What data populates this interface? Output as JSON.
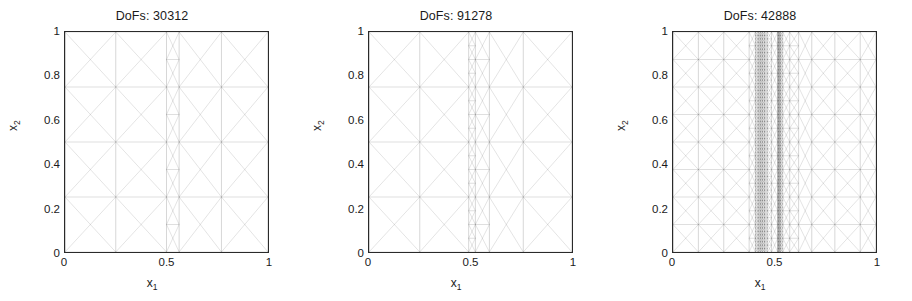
{
  "figure": {
    "background": "#ffffff",
    "line_color": "#2a2a2a",
    "text_color": "#1a1a1a"
  },
  "axes": {
    "xlabel": "x",
    "xlabel_sub": "1",
    "ylabel": "x",
    "ylabel_sub": "2",
    "xticks": [
      "0",
      "0.5",
      "1"
    ],
    "xtick_values": [
      0,
      0.5,
      1
    ],
    "yticks": [
      "0",
      "0.2",
      "0.4",
      "0.6",
      "0.8",
      "1"
    ],
    "ytick_values": [
      0,
      0.2,
      0.4,
      0.6,
      0.8,
      1
    ],
    "xlim": [
      0,
      1
    ],
    "ylim": [
      0,
      1
    ]
  },
  "chart_data": {
    "type": "diagram",
    "subtype": "adaptive-finite-element-mesh",
    "xlabel": "x_1",
    "ylabel": "x_2",
    "xlim": [
      0,
      1
    ],
    "ylim": [
      0,
      1
    ],
    "grid": false,
    "legend": null,
    "panels": [
      {
        "index": 0,
        "title": "DoFs: 30312",
        "dofs": 30312,
        "base_divisions": 4,
        "coarse_pattern": "criss-cross",
        "refinement_bands": [
          {
            "center": 0.42,
            "half_width": 0.035,
            "density": "extreme",
            "label": "interior layer"
          },
          {
            "center": 0.42,
            "half_width": 0.105,
            "density": "high",
            "label": "transition"
          },
          {
            "center": 0.42,
            "half_width": 0.175,
            "density": "medium",
            "label": "graded"
          }
        ],
        "dark_band_x": [
          0.385,
          0.455
        ],
        "refined_span_x": [
          0.245,
          0.615
        ]
      },
      {
        "index": 1,
        "title": "DoFs: 91278",
        "dofs": 91278,
        "base_divisions": 4,
        "coarse_pattern": "criss-cross",
        "refinement_bands": [
          {
            "center": 0.425,
            "half_width": 0.028,
            "density": "extreme",
            "label": "interior layer"
          },
          {
            "center": 0.435,
            "half_width": 0.11,
            "density": "high",
            "label": "transition"
          },
          {
            "center": 0.44,
            "half_width": 0.215,
            "density": "medium",
            "label": "graded"
          }
        ],
        "dark_band_x": [
          0.397,
          0.453
        ],
        "refined_span_x": [
          0.225,
          0.655
        ]
      },
      {
        "index": 2,
        "title": "DoFs: 42888",
        "dofs": 42888,
        "base_divisions": 8,
        "coarse_pattern": "criss-cross",
        "refinement_bands": [
          {
            "center": 0.345,
            "half_width": 0.022,
            "density": "extreme",
            "label": "left layer"
          },
          {
            "center": 0.51,
            "half_width": 0.022,
            "density": "extreme",
            "label": "right layer"
          },
          {
            "center": 0.428,
            "half_width": 0.11,
            "density": "high",
            "label": "between layers"
          },
          {
            "center": 0.5,
            "half_width": 0.33,
            "density": "medium",
            "label": "graded"
          }
        ],
        "dark_band_x": [
          0.323,
          0.367,
          0.488,
          0.532
        ],
        "refined_span_x": [
          0.3,
          1.0
        ]
      }
    ]
  },
  "panels": [
    {
      "title": "DoFs: 30312"
    },
    {
      "title": "DoFs: 91278"
    },
    {
      "title": "DoFs: 42888"
    }
  ]
}
